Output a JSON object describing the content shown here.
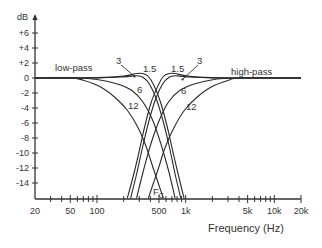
{
  "chart_data": {
    "type": "line",
    "title": "",
    "ylabel": "dB",
    "xlabel": "Frequency (Hz)",
    "xscale": "log",
    "xlim": [
      20,
      20000
    ],
    "ylim": [
      -16,
      8
    ],
    "grid": false,
    "y_ticks": [
      {
        "value": 6,
        "label": "+6"
      },
      {
        "value": 4,
        "label": "+4"
      },
      {
        "value": 2,
        "label": "+2"
      },
      {
        "value": 0,
        "label": "0"
      },
      {
        "value": -2,
        "label": "-2"
      },
      {
        "value": -4,
        "label": "-4"
      },
      {
        "value": -6,
        "label": "-6"
      },
      {
        "value": -8,
        "label": "-8"
      },
      {
        "value": -10,
        "label": "-10"
      },
      {
        "value": -12,
        "label": "-12"
      },
      {
        "value": -14,
        "label": "-14"
      }
    ],
    "x_major_ticks": [
      {
        "value": 20,
        "label": "20"
      },
      {
        "value": 50,
        "label": "50"
      },
      {
        "value": 100,
        "label": "100"
      },
      {
        "value": 500,
        "label": "500"
      },
      {
        "value": 1000,
        "label": "1k"
      },
      {
        "value": 5000,
        "label": "5k"
      },
      {
        "value": 10000,
        "label": "10k"
      },
      {
        "value": 20000,
        "label": "20k"
      }
    ],
    "x_minor_ticks": [
      30,
      40,
      60,
      70,
      80,
      90,
      200,
      300,
      400,
      600,
      700,
      800,
      900,
      2000,
      3000,
      4000,
      6000,
      7000,
      8000,
      9000
    ],
    "annotations": {
      "low_pass": "low-pass",
      "high_pass": "high-pass",
      "center_freq_main": "F",
      "center_freq_sub": "C"
    },
    "series": [
      {
        "name": "low-pass 1.5",
        "group": "low-pass",
        "label": "1.5",
        "points": [
          [
            20,
            0
          ],
          [
            100,
            0.05
          ],
          [
            200,
            0.25
          ],
          [
            280,
            0.6
          ],
          [
            330,
            0.6
          ],
          [
            380,
            0.2
          ],
          [
            440,
            -1
          ],
          [
            520,
            -3.2
          ],
          [
            620,
            -6.5
          ],
          [
            740,
            -10.5
          ],
          [
            870,
            -14
          ],
          [
            960,
            -16
          ]
        ]
      },
      {
        "name": "low-pass 3",
        "group": "low-pass",
        "label": "3",
        "points": [
          [
            20,
            0
          ],
          [
            100,
            0.02
          ],
          [
            200,
            0.15
          ],
          [
            280,
            0.3
          ],
          [
            330,
            0.1
          ],
          [
            390,
            -0.8
          ],
          [
            460,
            -2.6
          ],
          [
            550,
            -5.5
          ],
          [
            650,
            -9
          ],
          [
            760,
            -12.8
          ],
          [
            880,
            -16
          ]
        ]
      },
      {
        "name": "low-pass 6",
        "group": "low-pass",
        "label": "6",
        "points": [
          [
            20,
            0
          ],
          [
            60,
            0
          ],
          [
            100,
            -0.2
          ],
          [
            170,
            -0.8
          ],
          [
            250,
            -1.7
          ],
          [
            330,
            -3.2
          ],
          [
            420,
            -5.5
          ],
          [
            520,
            -8.6
          ],
          [
            640,
            -12.3
          ],
          [
            760,
            -16
          ]
        ]
      },
      {
        "name": "low-pass 12",
        "group": "low-pass",
        "label": "12",
        "points": [
          [
            20,
            0
          ],
          [
            50,
            0
          ],
          [
            70,
            -0.3
          ],
          [
            110,
            -1.2
          ],
          [
            160,
            -2.6
          ],
          [
            220,
            -4.3
          ],
          [
            290,
            -6.6
          ],
          [
            360,
            -9.2
          ],
          [
            430,
            -12
          ],
          [
            500,
            -14.3
          ],
          [
            560,
            -16
          ]
        ]
      },
      {
        "name": "high-pass 1.5",
        "group": "high-pass",
        "label": "1.5",
        "points": [
          [
            220,
            -16
          ],
          [
            245,
            -14
          ],
          [
            290,
            -10.5
          ],
          [
            345,
            -6.5
          ],
          [
            410,
            -3.2
          ],
          [
            490,
            -1
          ],
          [
            560,
            0.2
          ],
          [
            650,
            0.6
          ],
          [
            760,
            0.6
          ],
          [
            1050,
            0.25
          ],
          [
            2000,
            0.05
          ],
          [
            6000,
            0
          ],
          [
            20000,
            0
          ]
        ]
      },
      {
        "name": "high-pass 3",
        "group": "high-pass",
        "label": "3",
        "points": [
          [
            240,
            -16
          ],
          [
            280,
            -12.8
          ],
          [
            330,
            -9
          ],
          [
            390,
            -5.5
          ],
          [
            465,
            -2.6
          ],
          [
            550,
            -0.8
          ],
          [
            650,
            0.1
          ],
          [
            760,
            0.3
          ],
          [
            1050,
            0.15
          ],
          [
            2000,
            0.02
          ],
          [
            6000,
            0
          ],
          [
            20000,
            0
          ]
        ]
      },
      {
        "name": "high-pass 6",
        "group": "high-pass",
        "label": "6",
        "points": [
          [
            280,
            -16
          ],
          [
            335,
            -12.3
          ],
          [
            410,
            -8.6
          ],
          [
            510,
            -5.5
          ],
          [
            640,
            -3.2
          ],
          [
            850,
            -1.7
          ],
          [
            1250,
            -0.8
          ],
          [
            2100,
            -0.2
          ],
          [
            3500,
            0
          ],
          [
            20000,
            0
          ]
        ]
      },
      {
        "name": "high-pass 12",
        "group": "high-pass",
        "label": "12",
        "points": [
          [
            380,
            -16
          ],
          [
            425,
            -14.3
          ],
          [
            495,
            -12
          ],
          [
            590,
            -9.2
          ],
          [
            740,
            -6.6
          ],
          [
            970,
            -4.3
          ],
          [
            1330,
            -2.6
          ],
          [
            1940,
            -1.2
          ],
          [
            3050,
            -0.3
          ],
          [
            4200,
            0
          ],
          [
            20000,
            0
          ]
        ]
      }
    ]
  }
}
